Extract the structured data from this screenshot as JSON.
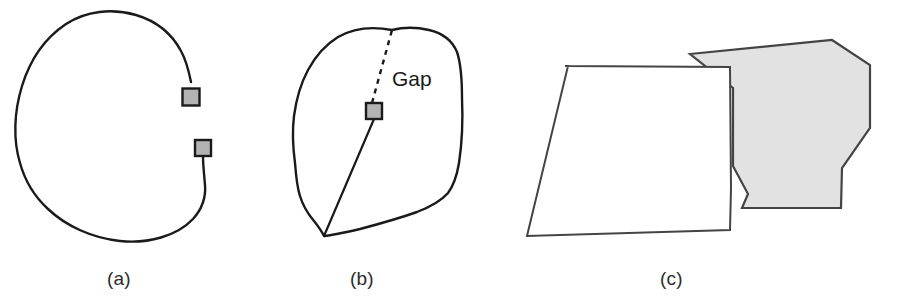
{
  "figure": {
    "background_color": "#ffffff",
    "width": 905,
    "height": 308,
    "stroke_color": "#1a1a1a",
    "marker_fill_color": "#b3b3b3",
    "marker_stroke_color": "#1a1a1a",
    "shaded_fill_color": "#e2e2e2",
    "shaded_stroke_color": "#444444"
  },
  "panels": [
    {
      "id": "a",
      "caption": "(a)",
      "description": "Open blob contour with two endpoint markers leaving a gap",
      "markers": [
        {
          "name": "endpoint-marker-upper",
          "x": 191,
          "y": 97,
          "size": 17
        },
        {
          "name": "endpoint-marker-lower",
          "x": 203,
          "y": 148,
          "size": 16
        }
      ],
      "contour_path": "M 191 82 C 189 72 186 60 181 51 C 172 34 156 21 136 15 C 112 8 86 11 66 24 C 45 38 30 60 22 86 C 14 112 13 140 20 163 C 25 181 35 197 48 209 C 66 226 92 238 120 241 C 148 244 177 236 193 219 C 202 209 206 197 205 185 C 204 173 203 164 203 157"
    },
    {
      "id": "b",
      "caption": "(b)",
      "label": "Gap",
      "label_x": 392,
      "label_y": 86,
      "description": "Closed blob contour with a solid chord and a dashed gap segment joined at a marker",
      "markers": [
        {
          "name": "junction-marker",
          "x": 374,
          "y": 111,
          "size": 16
        }
      ],
      "contour_path": "M 392 30 C 371 26 352 29 338 37 C 325 45 315 57 308 70 C 300 85 296 101 294 116 C 292 132 293 148 295 163 C 296 176 297 187 300 196 C 303 206 308 214 314 221 C 318 226 321 230 324 236 C 334 235 347 232 360 229 C 379 224 400 218 417 212 C 430 207 441 201 448 193 C 454 185 457 175 459 163 C 462 143 463 120 462 98 C 462 80 461 64 457 52 C 452 40 442 33 429 30 C 416 27 404 27 392 30 Z",
      "solid_chord_path": "M 324 236 L 374 119",
      "dashed_gap_path": "M 372 103 L 392 30",
      "dash_pattern": "5,5"
    },
    {
      "id": "c",
      "caption": "(c)",
      "description": "Two adjacent polygons merging: an unfilled quadrilateral on the left overlapping a shaded hexagon on the right",
      "white_polygon": {
        "name": "left-unfilled-polygon",
        "points": "565,66 730,67 731,188 730,230 527,236 568,66",
        "vertices": [
          [
            565,
            66
          ],
          [
            730,
            67
          ],
          [
            731,
            188
          ],
          [
            730,
            230
          ],
          [
            527,
            236
          ]
        ],
        "fill": "#ffffff"
      },
      "shaded_polygon": {
        "name": "right-shaded-polygon",
        "points": "690,54 832,40 870,65 870,128 842,168 841,208 742,208 748,194 733,166 733,88 690,54",
        "vertices": [
          [
            690,
            54
          ],
          [
            832,
            40
          ],
          [
            872,
            145
          ],
          [
            841,
            208
          ],
          [
            742,
            208
          ],
          [
            748,
            165
          ],
          [
            733,
            88
          ]
        ],
        "fill": "#e2e2e2"
      }
    }
  ]
}
